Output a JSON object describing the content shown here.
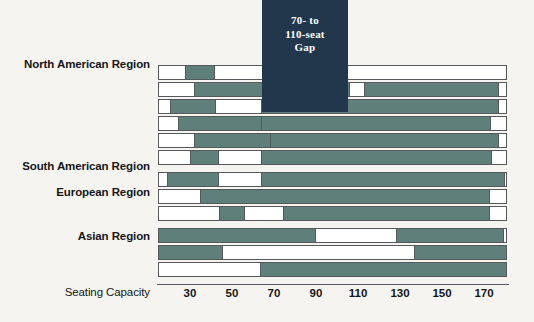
{
  "chart_data": {
    "type": "bar",
    "orientation": "horizontal",
    "title": "",
    "xlabel": "Seating Capacity",
    "ylabel": "",
    "xlim": [
      14.8,
      181
    ],
    "xticks": [
      30,
      50,
      70,
      90,
      110,
      130,
      150,
      170
    ],
    "grid": false,
    "legend": null,
    "annotations": [
      {
        "name": "gap-band",
        "text": "70- to 110-seat Gap",
        "lines": [
          "70- to",
          "110-seat",
          "Gap"
        ],
        "x_start": 64,
        "x_end": 105,
        "color": "#22374b"
      }
    ],
    "series_colors": {
      "covered": "#5f807a",
      "uncovered": "#ffffff"
    },
    "groups": [
      {
        "label": "North American Region",
        "bars": [
          {
            "start": 14.8,
            "end": 181,
            "covered": [
              [
                27.5,
                42.0
              ]
            ]
          },
          {
            "start": 14.8,
            "end": 181,
            "covered": [
              [
                32.0,
                106.0
              ],
              [
                113.0,
                177.0
              ]
            ]
          },
          {
            "start": 14.8,
            "end": 181,
            "covered": [
              [
                20.5,
                42.5
              ],
              [
                64.0,
                177.0
              ]
            ]
          },
          {
            "start": 14.8,
            "end": 181,
            "covered": [
              [
                24.5,
                86.5
              ],
              [
                64.0,
                173.5
              ]
            ]
          },
          {
            "start": 14.8,
            "end": 181,
            "covered": [
              [
                32.0,
                86.5
              ],
              [
                68.0,
                177.0
              ]
            ]
          },
          {
            "start": 14.8,
            "end": 181,
            "covered": [
              [
                30.0,
                44.0
              ],
              [
                64.0,
                174.0
              ]
            ]
          }
        ]
      },
      {
        "label": "South American Region",
        "bars": [
          {
            "start": 14.8,
            "end": 181,
            "covered": [
              [
                19.0,
                44.0
              ],
              [
                64.0,
                180.0
              ]
            ]
          }
        ]
      },
      {
        "label": "European Region",
        "bars": [
          {
            "start": 14.8,
            "end": 181,
            "covered": [
              [
                35.0,
                173.0
              ]
            ]
          },
          {
            "start": 14.8,
            "end": 181,
            "covered": [
              [
                44.0,
                56.0
              ],
              [
                74.5,
                173.0
              ]
            ]
          }
        ]
      },
      {
        "label": "Asian Region",
        "bars": [
          {
            "start": 14.8,
            "end": 181,
            "covered": [
              [
                14.8,
                90.0
              ],
              [
                128.0,
                179.5
              ]
            ]
          },
          {
            "start": 14.8,
            "end": 181,
            "covered": [
              [
                14.8,
                45.5
              ],
              [
                136.5,
                181.0
              ]
            ]
          },
          {
            "start": 14.8,
            "end": 181,
            "covered": [
              [
                63.5,
                181.0
              ]
            ]
          }
        ]
      }
    ]
  },
  "labels": {
    "north_american": "North American Region",
    "south_american": "South American Region",
    "european": "European Region",
    "asian": "Asian Region",
    "seating_capacity": "Seating Capacity"
  },
  "gap": {
    "line1": "70- to",
    "line2": "110-seat",
    "line3": "Gap"
  },
  "ticks": {
    "t30": "30",
    "t50": "50",
    "t70": "70",
    "t90": "90",
    "t110": "110",
    "t130": "130",
    "t150": "150",
    "t170": "170"
  }
}
